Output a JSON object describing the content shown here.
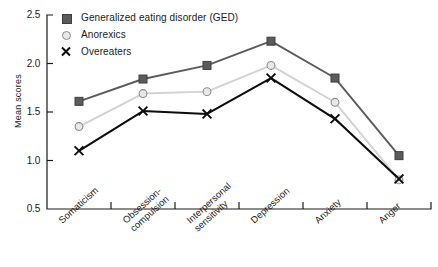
{
  "chart_data": {
    "type": "line",
    "title": "",
    "xlabel": "",
    "ylabel": "Mean scores",
    "ylim": [
      0.5,
      2.5
    ],
    "yticks": [
      "0.5",
      "1.0",
      "1.5",
      "2.0",
      "2.5"
    ],
    "grid": false,
    "legend_position": "top-left",
    "categories": [
      "Somaticism",
      "Obsession-\ncompulsion",
      "Interpersonal\nsensitivity",
      "Depression",
      "Anxiety",
      "Anger"
    ],
    "series": [
      {
        "name": "Generalized eating disorder (GED)",
        "marker": "square",
        "color": "#5b5b5b",
        "values": [
          1.61,
          1.84,
          1.98,
          2.23,
          1.85,
          1.05
        ]
      },
      {
        "name": "Anorexics",
        "marker": "circle",
        "color": "#d2d2d2",
        "values": [
          1.35,
          1.69,
          1.71,
          1.98,
          1.6,
          0.8
        ]
      },
      {
        "name": "Overeaters",
        "marker": "x",
        "color": "#0d0d0d",
        "values": [
          1.1,
          1.51,
          1.48,
          1.85,
          1.43,
          0.81
        ]
      }
    ]
  },
  "legend": {
    "items": [
      {
        "label": "Generalized eating disorder (GED)",
        "marker": "square",
        "color": "#5b5b5b"
      },
      {
        "label": "Anorexics",
        "marker": "circle",
        "color": "#d2d2d2"
      },
      {
        "label": "Overeaters",
        "marker": "x",
        "color": "#0d0d0d"
      }
    ]
  },
  "axis": {
    "y_label": "Mean scores",
    "y_ticks": [
      "2.5",
      "2.0",
      "1.5",
      "1.0",
      "0.5"
    ],
    "x_ticks": [
      "Somaticism",
      "Obsession-|compulsion",
      "Interpersonal|sensitivity",
      "Depression",
      "Anxiety",
      "Anger"
    ]
  }
}
